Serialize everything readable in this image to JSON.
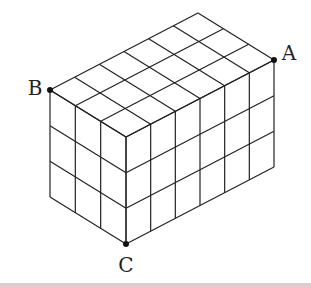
{
  "figure": {
    "type": "isometric cuboid made of unit cubes",
    "cubes": {
      "width": 6,
      "depth": 3,
      "height": 3
    },
    "points": [
      {
        "id": "A",
        "label": "A",
        "x": 274,
        "y": 60,
        "label_x": 289,
        "label_y": 60
      },
      {
        "id": "B",
        "label": "B",
        "x": 50,
        "y": 90,
        "label_x": 35,
        "label_y": 95
      },
      {
        "id": "C",
        "label": "C",
        "x": 126,
        "y": 244,
        "label_x": 126,
        "label_y": 272
      }
    ],
    "geometry": {
      "front_top": [
        126,
        137
      ],
      "width_vec": [
        148,
        -77
      ],
      "depth_vec": [
        -76,
        -47
      ],
      "height": 107
    },
    "line_color": "#222222",
    "bottom_bar_color": "#e9c9cc"
  }
}
